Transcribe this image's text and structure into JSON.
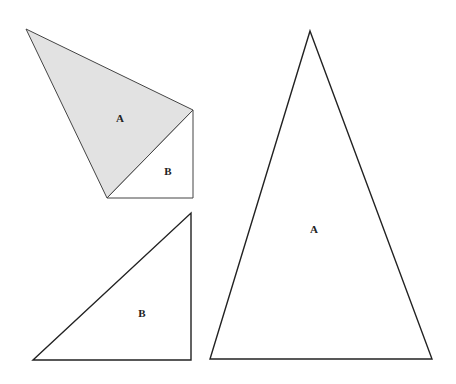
{
  "figures": {
    "composite": {
      "shape_a": {
        "label": "A",
        "points": "26,29 193,110 107,198",
        "fill": "#e2e2e2",
        "label_pos": [
          120,
          122
        ]
      },
      "shape_b": {
        "label": "B",
        "points": "107,198 193,110 193,198",
        "fill": "#ffffff",
        "label_pos": [
          168,
          175
        ]
      }
    },
    "triangle_b": {
      "label": "B",
      "points": "33,360 191,213 191,360",
      "fill": "#ffffff",
      "label_pos": [
        142,
        317
      ]
    },
    "triangle_a": {
      "label": "A",
      "points": "310,31 432,359 210,359",
      "fill": "#ffffff",
      "label_pos": [
        314,
        233
      ]
    }
  },
  "stroke_color": "#222222"
}
